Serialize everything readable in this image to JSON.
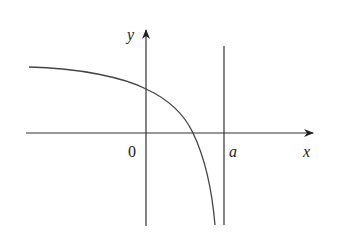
{
  "diagram": {
    "type": "function-graph",
    "axes": {
      "x_label": "x",
      "y_label": "y",
      "origin_label": "0"
    },
    "asymptote": {
      "label": "a",
      "orientation": "vertical"
    },
    "curve": {
      "description": "decreasing concave-down curve approaching a horizontal asymptote on the left and diving to negative infinity at x = a"
    },
    "colors": {
      "stroke": "#333333",
      "background": "#ffffff"
    }
  }
}
